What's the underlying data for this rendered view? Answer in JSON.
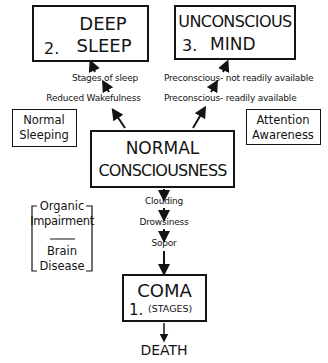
{
  "diagram": {
    "nodes": {
      "deep_sleep": {
        "number": "2.",
        "line1": "DEEP",
        "line2": "SLEEP"
      },
      "unconscious_mind": {
        "number": "3.",
        "line1": "UNCONSCIOUS",
        "line2": "MIND"
      },
      "normal_consciousness": {
        "line1": "NORMAL",
        "line2": "CONSCIOUSNESS"
      },
      "normal_sleeping": {
        "line1": "Normal",
        "line2": "Sleeping"
      },
      "attention_awareness": {
        "line1": "Attention",
        "line2": "Awareness"
      },
      "coma": {
        "number": "1.",
        "line1": "COMA",
        "line2": "(STAGES)"
      },
      "death": {
        "label": "DEATH"
      }
    },
    "left_path": {
      "steps": [
        "Reduced Wakefulness",
        "Stages of sleep"
      ]
    },
    "right_path": {
      "steps": [
        "Preconscious-  readily available",
        "Preconscious- not readily  available"
      ]
    },
    "down_path": {
      "steps": [
        "Clouding",
        "Drowsiness",
        "Sopor"
      ]
    },
    "bracket_group": {
      "top_line1": "Organic",
      "top_line2": "Impairment",
      "bottom_line1": "Brain",
      "bottom_line2": "Disease"
    }
  }
}
